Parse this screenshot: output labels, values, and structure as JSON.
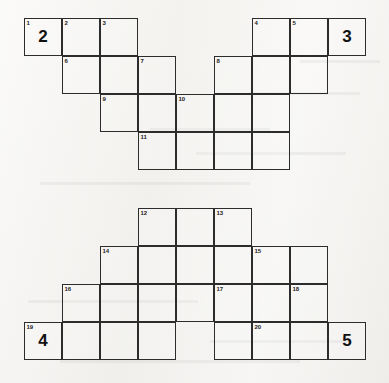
{
  "puzzle": {
    "title": "Crossword Grid",
    "cell_size": 38,
    "origin_x": 24,
    "origin_y": 18,
    "columns": 9,
    "rows": 10,
    "ink_color": "#2c2c2c",
    "paper_color": "#f2f1ef",
    "cells": [
      {
        "name": "cell-r0c0",
        "col": 0,
        "row": 0,
        "number": "1",
        "answer": ""
      },
      {
        "name": "cell-r0c1",
        "col": 1,
        "row": 0,
        "number": "2",
        "answer": ""
      },
      {
        "name": "cell-r0c2",
        "col": 2,
        "row": 0,
        "number": "3",
        "answer": ""
      },
      {
        "name": "cell-r0c6",
        "col": 6,
        "row": 0,
        "number": "4",
        "answer": ""
      },
      {
        "name": "cell-r0c7",
        "col": 7,
        "row": 0,
        "number": "5",
        "answer": ""
      },
      {
        "name": "cell-r1c1",
        "col": 1,
        "row": 1,
        "number": "6",
        "answer": ""
      },
      {
        "name": "cell-r1c2",
        "col": 2,
        "row": 1,
        "number": "",
        "answer": ""
      },
      {
        "name": "cell-r1c3",
        "col": 3,
        "row": 1,
        "number": "7",
        "answer": ""
      },
      {
        "name": "cell-r1c5",
        "col": 5,
        "row": 1,
        "number": "8",
        "answer": ""
      },
      {
        "name": "cell-r1c6",
        "col": 6,
        "row": 1,
        "number": "",
        "answer": ""
      },
      {
        "name": "cell-r1c7",
        "col": 7,
        "row": 1,
        "number": "",
        "answer": ""
      },
      {
        "name": "cell-r2c2",
        "col": 2,
        "row": 2,
        "number": "9",
        "answer": ""
      },
      {
        "name": "cell-r2c3",
        "col": 3,
        "row": 2,
        "number": "",
        "answer": ""
      },
      {
        "name": "cell-r2c4",
        "col": 4,
        "row": 2,
        "number": "10",
        "answer": ""
      },
      {
        "name": "cell-r2c5",
        "col": 5,
        "row": 2,
        "number": "",
        "answer": ""
      },
      {
        "name": "cell-r2c6",
        "col": 6,
        "row": 2,
        "number": "",
        "answer": ""
      },
      {
        "name": "cell-r3c3",
        "col": 3,
        "row": 3,
        "number": "11",
        "answer": ""
      },
      {
        "name": "cell-r3c4",
        "col": 4,
        "row": 3,
        "number": "",
        "answer": ""
      },
      {
        "name": "cell-r3c5",
        "col": 5,
        "row": 3,
        "number": "",
        "answer": ""
      },
      {
        "name": "cell-r3c6",
        "col": 6,
        "row": 3,
        "number": "",
        "answer": ""
      },
      {
        "name": "cell-r5c3",
        "col": 3,
        "row": 5,
        "number": "12",
        "answer": ""
      },
      {
        "name": "cell-r5c4",
        "col": 4,
        "row": 5,
        "number": "",
        "answer": ""
      },
      {
        "name": "cell-r5c5",
        "col": 5,
        "row": 5,
        "number": "13",
        "answer": ""
      },
      {
        "name": "cell-r6c2",
        "col": 2,
        "row": 6,
        "number": "14",
        "answer": ""
      },
      {
        "name": "cell-r6c3",
        "col": 3,
        "row": 6,
        "number": "",
        "answer": ""
      },
      {
        "name": "cell-r6c4",
        "col": 4,
        "row": 6,
        "number": "",
        "answer": ""
      },
      {
        "name": "cell-r6c5",
        "col": 5,
        "row": 6,
        "number": "",
        "answer": ""
      },
      {
        "name": "cell-r6c6",
        "col": 6,
        "row": 6,
        "number": "15",
        "answer": ""
      },
      {
        "name": "cell-r6c7",
        "col": 7,
        "row": 6,
        "number": "",
        "answer": ""
      },
      {
        "name": "cell-r7c1",
        "col": 1,
        "row": 7,
        "number": "16",
        "answer": ""
      },
      {
        "name": "cell-r7c2",
        "col": 2,
        "row": 7,
        "number": "",
        "answer": ""
      },
      {
        "name": "cell-r7c3",
        "col": 3,
        "row": 7,
        "number": "",
        "answer": ""
      },
      {
        "name": "cell-r7c4",
        "col": 4,
        "row": 7,
        "number": "",
        "answer": ""
      },
      {
        "name": "cell-r7c5",
        "col": 5,
        "row": 7,
        "number": "17",
        "answer": ""
      },
      {
        "name": "cell-r7c6",
        "col": 6,
        "row": 7,
        "number": "",
        "answer": ""
      },
      {
        "name": "cell-r7c7",
        "col": 7,
        "row": 7,
        "number": "18",
        "answer": ""
      },
      {
        "name": "cell-r8c0",
        "col": 0,
        "row": 8,
        "number": "19",
        "answer": "4"
      },
      {
        "name": "cell-r8c1",
        "col": 1,
        "row": 8,
        "number": "",
        "answer": ""
      },
      {
        "name": "cell-r8c2",
        "col": 2,
        "row": 8,
        "number": "",
        "answer": ""
      },
      {
        "name": "cell-r8c3",
        "col": 3,
        "row": 8,
        "number": "",
        "answer": ""
      },
      {
        "name": "cell-r8c5",
        "col": 5,
        "row": 8,
        "number": "",
        "answer": ""
      },
      {
        "name": "cell-r8c6",
        "col": 6,
        "row": 8,
        "number": "20",
        "answer": ""
      },
      {
        "name": "cell-r8c7",
        "col": 7,
        "row": 8,
        "number": "",
        "answer": ""
      },
      {
        "name": "cell-r8c8",
        "col": 8,
        "row": 8,
        "number": "",
        "answer": "5"
      },
      {
        "name": "cell-r0c0-answer",
        "col": 0,
        "row": 0,
        "number": "",
        "answer": "2",
        "overlay": true
      },
      {
        "name": "cell-r0c8-answer",
        "col": 8,
        "row": 0,
        "number": "",
        "answer": "3"
      }
    ]
  },
  "background_artifacts": [
    {
      "name": "ghost-text-1",
      "text": "",
      "x": 0,
      "y": 0
    }
  ]
}
